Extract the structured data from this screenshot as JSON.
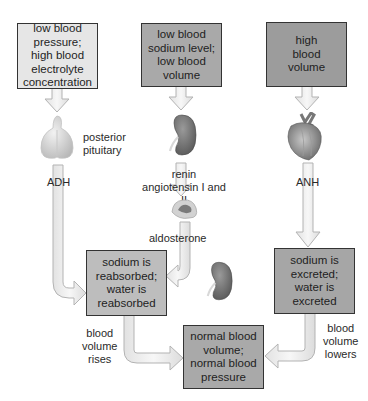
{
  "diagram": {
    "colors": {
      "box_light": "#e6e6e6",
      "box_medium": "#a9a9a9",
      "box_dark": "#9c9c9c",
      "box_reabsorb": "#bdbdbd",
      "arrow_fill": "#ececec",
      "arrow_stroke": "#b5b5b5",
      "border": "#333333"
    },
    "boxes": {
      "stimulus_low_pressure": "low blood\npressure;\nhigh blood\nelectrolyte\nconcentration",
      "stimulus_low_sodium": "low blood\nsodium level;\nlow blood\nvolume",
      "stimulus_high_volume": "high\nblood\nvolume",
      "response_reabsorbed": "sodium is\nreabsorbed;\nwater is\nreabsorbed",
      "response_excreted": "sodium is\nexcreted;\nwater is\nexcreted",
      "outcome_normal": "normal blood\nvolume;\nnormal blood\npressure"
    },
    "labels": {
      "posterior_pituitary": "posterior\npituitary",
      "adh": "ADH",
      "renin_angiotensin": "renin\nangiotensin I and II",
      "aldosterone": "aldosterone",
      "anh": "ANH",
      "blood_volume_rises": "blood\nvolume\nrises",
      "blood_volume_lowers": "blood\nvolume\nlowers"
    },
    "icons": [
      "pituitary-gland-icon",
      "kidney-icon",
      "adrenal-gland-icon",
      "kidney-icon",
      "heart-icon"
    ]
  }
}
